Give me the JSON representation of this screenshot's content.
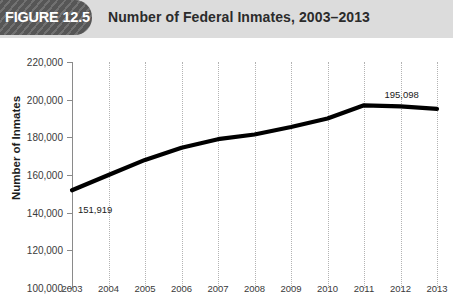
{
  "header": {
    "figure_tag": "FIGURE 12.5",
    "title": "Number of Federal Inmates, 2003–2013"
  },
  "chart_data": {
    "type": "line",
    "title": "Number of Federal Inmates, 2003–2013",
    "xlabel": "",
    "ylabel": "Number of Inmates",
    "categories": [
      "2003",
      "2004",
      "2005",
      "2006",
      "2007",
      "2008",
      "2009",
      "2010",
      "2011",
      "2012",
      "2013"
    ],
    "values": [
      151919,
      160000,
      168000,
      174500,
      179000,
      181500,
      185500,
      190000,
      197000,
      196500,
      195098
    ],
    "ylim": [
      100000,
      220000
    ],
    "ytick_step": 20000,
    "yticks": [
      "100,000",
      "120,000",
      "140,000",
      "160,000",
      "180,000",
      "200,000",
      "220,000"
    ],
    "grid": "vertical-dotted",
    "legend": "none",
    "line_color": "#000000",
    "annotations": [
      {
        "label": "151,919",
        "year": "2003",
        "value": 151919
      },
      {
        "label": "195,098",
        "year": "2012",
        "value": 195098
      }
    ]
  }
}
